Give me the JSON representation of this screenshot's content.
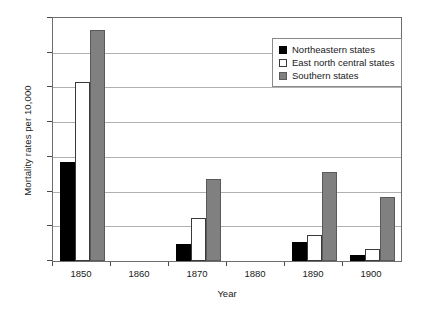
{
  "chart_data": {
    "type": "bar",
    "title": "",
    "xlabel": "Year",
    "ylabel": "Mortality rates per 10,000",
    "categories": [
      "1850",
      "1860",
      "1870",
      "1880",
      "1890",
      "1900"
    ],
    "series": [
      {
        "name": "Northeastern states",
        "color": "#000000",
        "values": [
          5.7,
          null,
          1.0,
          null,
          1.1,
          0.35
        ]
      },
      {
        "name": "East north central states",
        "color": "#ffffff",
        "values": [
          10.3,
          null,
          2.5,
          null,
          1.5,
          0.7
        ]
      },
      {
        "name": "Southern states",
        "color": "#808080",
        "values": [
          13.3,
          null,
          4.7,
          null,
          5.1,
          3.7
        ]
      }
    ],
    "ylim": [
      0,
      14
    ],
    "yticks": [
      0,
      2,
      4,
      6,
      8,
      10,
      12,
      14
    ],
    "grid": true,
    "legend_position": "upper-right"
  },
  "axis": {
    "y_tick_labels": [
      "0",
      "2",
      "4",
      "6",
      "8",
      "10",
      "12",
      "14"
    ],
    "x_tick_labels": [
      "1850",
      "1860",
      "1870",
      "1880",
      "1890",
      "1900"
    ],
    "y_title": "Mortality rates per 10,000",
    "x_title": "Year"
  },
  "legend": {
    "entries": [
      {
        "label": "Northeastern states"
      },
      {
        "label": "East north central states"
      },
      {
        "label": "Southern states"
      }
    ]
  }
}
